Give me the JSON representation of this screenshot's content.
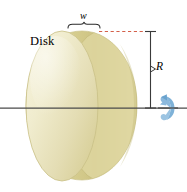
{
  "figure": {
    "background_color": "#ffffff",
    "width": 187,
    "height": 192
  },
  "labels": {
    "disk": "Disk",
    "width_symbol": "w",
    "radius_symbol": "R"
  },
  "colors": {
    "disk_light": "#f2eecd",
    "disk_mid": "#e8e1b4",
    "disk_dark": "#cfc78a",
    "disk_face": "#ddd59e",
    "disk_edge": "#c6bd7f",
    "axis_line": "#4a4a4a",
    "dashed_line": "#d4604a",
    "dimension_line": "#3a3a3a",
    "rotation_arrow": "#8cb9dd",
    "rotation_arrow_dark": "#6aa3ce",
    "text": "#000000"
  },
  "geometry": {
    "disk_left_x": 26,
    "disk_right_x": 137,
    "disk_top_y": 31,
    "disk_bottom_y": 180,
    "axis_y": 108,
    "dimension_x": 150,
    "brace_left_x": 68,
    "brace_right_x": 100,
    "brace_y": 23,
    "dashed_line_y": 31,
    "rotation_arrow_x": 168,
    "rotation_arrow_y": 108
  },
  "elements": {
    "axis_line_name": "rotation-axis-line",
    "rotation_arrow_name": "rotation-direction-arrow",
    "radius_dimension_name": "radius-dimension-line",
    "width_brace_name": "width-brace",
    "dashed_leader_name": "dashed-leader-line"
  }
}
